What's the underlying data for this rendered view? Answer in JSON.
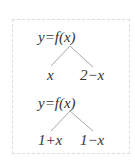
{
  "diagrams": [
    {
      "root": "y=f(x)",
      "left": "x",
      "right": "2−x"
    },
    {
      "root": "y=f(x)",
      "left": "1+x",
      "right": "1−x"
    }
  ],
  "colors": {
    "line": "#aaaaaa",
    "text": "#333333",
    "border": "#dcdcdc"
  }
}
